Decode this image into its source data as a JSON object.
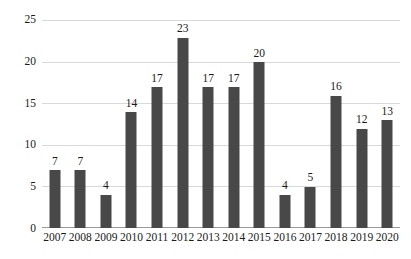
{
  "chart_data": {
    "type": "bar",
    "title": "",
    "subtitle": "",
    "xlabel": "",
    "ylabel": "",
    "categories": [
      "2007",
      "2008",
      "2009",
      "2010",
      "2011",
      "2012",
      "2013",
      "2014",
      "2015",
      "2016",
      "2017",
      "2018",
      "2019",
      "2020"
    ],
    "values": [
      7,
      7,
      4,
      14,
      17,
      23,
      17,
      17,
      20,
      4,
      5,
      16,
      12,
      13
    ],
    "data_labels": [
      "7",
      "7",
      "4",
      "14",
      "17",
      "23",
      "17",
      "17",
      "20",
      "4",
      "5",
      "16",
      "12",
      "13"
    ],
    "ylim": [
      0,
      25
    ],
    "ytick_values": [
      0,
      5,
      10,
      15,
      20,
      25
    ],
    "ytick_labels": [
      "0",
      "5",
      "10",
      "15",
      "20",
      "25"
    ],
    "grid": true,
    "grid_axis": "y",
    "legend": false,
    "legend_position": "none",
    "annotations": [],
    "colors": {
      "bar": "#484848",
      "gridline": "#d9d9d9",
      "axis": "#9a9a9a",
      "text": "#1a1a1a",
      "background": "#ffffff"
    }
  }
}
